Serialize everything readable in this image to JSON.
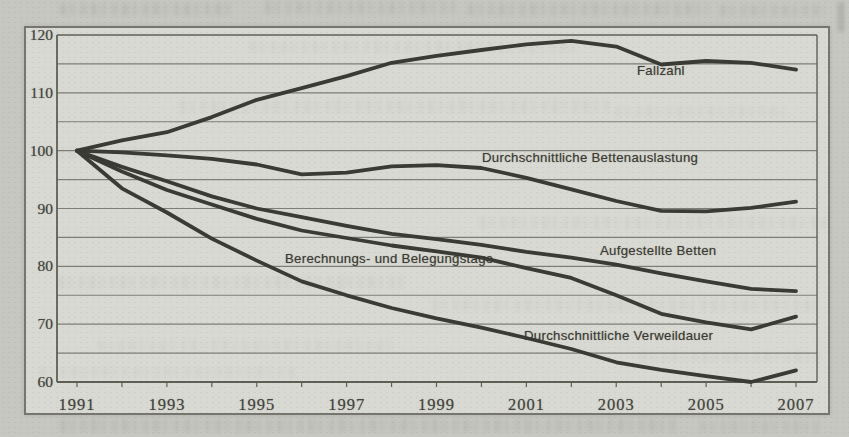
{
  "chart_data": {
    "type": "line",
    "title": "",
    "x": [
      1991,
      1992,
      1993,
      1994,
      1995,
      1996,
      1997,
      1998,
      1999,
      2000,
      2001,
      2002,
      2003,
      2004,
      2005,
      2006,
      2007
    ],
    "x_axis_tick_labels": [
      "1991",
      "1993",
      "1995",
      "1997",
      "1999",
      "2001",
      "2003",
      "2005",
      "2007"
    ],
    "y_axis_tick_labels": [
      "120",
      "110",
      "100",
      "90",
      "80",
      "70",
      "60"
    ],
    "y_axis_tick_values": [
      120,
      110,
      100,
      90,
      80,
      70,
      60
    ],
    "ylim": [
      60,
      120
    ],
    "grid": true,
    "grid_step": 5,
    "legend_position": "inline-labels-on-chart",
    "index_base": "1991 = 100",
    "series": [
      {
        "name": "Fallzahl",
        "values": [
          100,
          101.8,
          103.2,
          105.8,
          108.8,
          110.8,
          112.9,
          115.2,
          116.4,
          117.4,
          118.4,
          119.0,
          118.0,
          114.9,
          115.5,
          115.2,
          114.0
        ],
        "label_x": 637,
        "label_y": 63
      },
      {
        "name": "Durchschnittliche Bettenauslastung",
        "values": [
          100,
          99.7,
          99.2,
          98.6,
          97.6,
          95.9,
          96.2,
          97.3,
          97.5,
          97.0,
          95.3,
          93.3,
          91.3,
          89.6,
          89.5,
          90.1,
          91.2
        ],
        "label_x": 482,
        "label_y": 150
      },
      {
        "name": "Aufgestellte Betten",
        "values": [
          100,
          97.2,
          94.7,
          92.1,
          90.0,
          88.5,
          87.0,
          85.6,
          84.7,
          83.7,
          82.5,
          81.5,
          80.3,
          78.8,
          77.4,
          76.1,
          75.7
        ],
        "label_x": 600,
        "label_y": 243
      },
      {
        "name": "Berechnungs- und Belegungstage",
        "values": [
          100,
          96.4,
          93.2,
          90.7,
          88.2,
          86.2,
          84.9,
          83.6,
          82.6,
          81.5,
          79.7,
          78.0,
          75.0,
          71.8,
          70.3,
          69.1,
          71.3
        ],
        "label_x": 285,
        "label_y": 251
      },
      {
        "name": "Durchschnittliche Verweildauer",
        "values": [
          100,
          93.5,
          89.3,
          84.8,
          81.0,
          77.4,
          75.0,
          72.8,
          71.0,
          69.4,
          67.6,
          65.7,
          63.4,
          62.1,
          61.0,
          60.0,
          62.0
        ],
        "label_x": 524,
        "label_y": 328
      }
    ],
    "colors": {
      "line": "#3a3a34",
      "grid": "#6f6f66",
      "frame": "#5f5f56",
      "text": "#45453e",
      "paper": "#c7c7c2",
      "plot_background": "#d9d9d4"
    }
  }
}
